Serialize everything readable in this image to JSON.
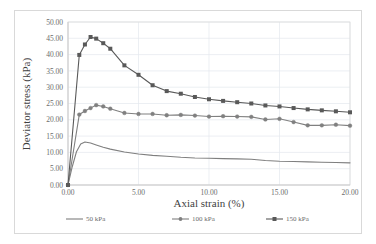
{
  "chart_data": {
    "type": "line",
    "title": "",
    "xlabel": "Axial strain (%)",
    "ylabel": "Deviator stress (kPa)",
    "xlim": [
      0,
      20
    ],
    "ylim": [
      0,
      50
    ],
    "xticks": [
      "0.00",
      "5.00",
      "10.00",
      "15.00",
      "20.00"
    ],
    "yticks": [
      "0.00",
      "5.00",
      "10.00",
      "15.00",
      "20.00",
      "25.00",
      "30.00",
      "35.00",
      "40.00",
      "45.00",
      "50.00"
    ],
    "xtick_values": [
      0,
      5,
      10,
      15,
      20
    ],
    "ytick_values": [
      0,
      5,
      10,
      15,
      20,
      25,
      30,
      35,
      40,
      45,
      50
    ],
    "grid": true,
    "legend_position": "bottom",
    "series": [
      {
        "name": "50 kPa",
        "marker": "none",
        "color": "#7f7f7f",
        "x": [
          0.0,
          0.3,
          0.6,
          0.9,
          1.2,
          1.6,
          2.0,
          2.5,
          3.0,
          4.0,
          5.0,
          6.0,
          7.0,
          8.0,
          9.0,
          10.0,
          11.0,
          12.0,
          13.0,
          14.0,
          15.0,
          16.0,
          17.0,
          18.0,
          19.0,
          20.0
        ],
        "y": [
          0.0,
          5.6,
          10.2,
          12.6,
          13.2,
          12.9,
          12.3,
          11.6,
          11.0,
          10.1,
          9.5,
          9.1,
          8.8,
          8.5,
          8.3,
          8.2,
          8.1,
          8.0,
          7.9,
          7.5,
          7.3,
          7.2,
          7.1,
          7.0,
          6.9,
          6.8
        ]
      },
      {
        "name": "100 kPa",
        "marker": "circle",
        "color": "#808080",
        "x": [
          0.0,
          0.8,
          1.2,
          1.6,
          2.0,
          2.5,
          3.0,
          4.0,
          5.0,
          6.0,
          7.0,
          8.0,
          9.0,
          10.0,
          11.0,
          12.0,
          13.0,
          14.0,
          15.0,
          16.0,
          17.0,
          18.0,
          19.0,
          20.0
        ],
        "y": [
          0.0,
          21.6,
          22.7,
          23.6,
          24.5,
          24.1,
          23.4,
          22.1,
          21.8,
          21.8,
          21.4,
          21.5,
          21.3,
          21.0,
          21.1,
          21.0,
          20.9,
          20.1,
          20.3,
          19.3,
          18.3,
          18.3,
          18.5,
          18.2
        ]
      },
      {
        "name": "150 kPa",
        "marker": "square",
        "color": "#595959",
        "x": [
          0.0,
          0.8,
          1.2,
          1.6,
          2.0,
          2.5,
          3.0,
          4.0,
          5.0,
          6.0,
          7.0,
          8.0,
          9.0,
          10.0,
          11.0,
          12.0,
          13.0,
          14.0,
          15.0,
          16.0,
          17.0,
          18.0,
          19.0,
          20.0
        ],
        "y": [
          0.0,
          39.9,
          43.1,
          45.4,
          44.9,
          43.5,
          41.8,
          36.7,
          33.8,
          30.6,
          28.8,
          28.0,
          27.0,
          26.3,
          25.8,
          25.4,
          25.0,
          24.4,
          24.1,
          23.6,
          23.2,
          22.9,
          22.6,
          22.3
        ]
      }
    ]
  },
  "legend": {
    "items": [
      {
        "label": "50 kPa"
      },
      {
        "label": "100 kPa"
      },
      {
        "label": "150 kPa"
      }
    ]
  },
  "colors": {
    "series_50": "#7f7f7f",
    "series_100": "#808080",
    "series_150": "#595959",
    "grid": "#e4e8ee",
    "axis": "#c8c8c8",
    "text": "#6b6b6b",
    "frame": "#d9d9d9"
  }
}
